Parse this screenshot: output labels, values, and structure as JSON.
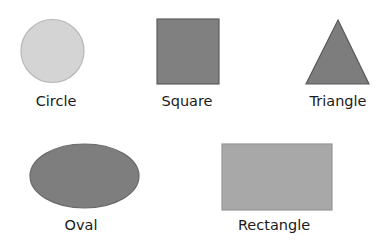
{
  "diagram": {
    "shapes": [
      {
        "id": "circle",
        "label": "Circle",
        "type": "circle",
        "fill": "#d4d4d4",
        "stroke": "#b8b8b8",
        "geometry": {
          "cx": 52.5,
          "cy": 51,
          "r": 31.5
        },
        "label_pos": {
          "x": 56,
          "y": 94
        }
      },
      {
        "id": "square",
        "label": "Square",
        "type": "rect",
        "fill": "#808080",
        "stroke": "#5e5e5e",
        "geometry": {
          "x": 157,
          "y": 19,
          "width": 62,
          "height": 65
        },
        "label_pos": {
          "x": 187,
          "y": 94
        }
      },
      {
        "id": "triangle",
        "label": "Triangle",
        "type": "polygon",
        "fill": "#7d7d7d",
        "stroke": "#5a5a5a",
        "geometry": {
          "points": "338,20 369,84 306,84"
        },
        "label_pos": {
          "x": 338,
          "y": 94
        }
      },
      {
        "id": "oval",
        "label": "Oval",
        "type": "ellipse",
        "fill": "#7e7e7e",
        "stroke": "#6a6a6a",
        "geometry": {
          "cx": 84.5,
          "cy": 176,
          "rx": 54.5,
          "ry": 32
        },
        "label_pos": {
          "x": 81,
          "y": 218
        }
      },
      {
        "id": "rectangle",
        "label": "Rectangle",
        "type": "rect",
        "fill": "#a8a8a8",
        "stroke": "#969696",
        "geometry": {
          "x": 222,
          "y": 144,
          "width": 110,
          "height": 66
        },
        "label_pos": {
          "x": 274,
          "y": 218
        }
      }
    ]
  }
}
